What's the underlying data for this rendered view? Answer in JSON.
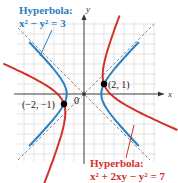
{
  "figure": {
    "blue_title": "Hyperbola:",
    "blue_equation": "x² − y² = 3",
    "red_title": "Hyperbola:",
    "red_equation": "x² + 2xy − y² = 7",
    "axis_x_label": "x",
    "axis_y_label": "y",
    "origin_label": "0",
    "point1_label": "(2, 1)",
    "point2_label": "(−2, −1)",
    "colors": {
      "blue": "#2b7fc3",
      "red": "#d3312b",
      "asymptote": "#888888",
      "grid": "#d8d8d8",
      "axis": "#333333"
    }
  },
  "chart_data": {
    "type": "line",
    "title": "",
    "xlabel": "x",
    "ylabel": "y",
    "xlim": [
      -6.5,
      7
    ],
    "ylim": [
      -6.5,
      7
    ],
    "grid": true,
    "series": [
      {
        "name": "x^2 - y^2 = 3",
        "color": "#2b7fc3",
        "kind": "hyperbola"
      },
      {
        "name": "x^2 + 2xy - y^2 = 7",
        "color": "#d3312b",
        "kind": "hyperbola"
      },
      {
        "name": "asymptote y = x",
        "color": "#888888",
        "kind": "dashed-line"
      },
      {
        "name": "asymptote y = -x",
        "color": "#888888",
        "kind": "dashed-line"
      }
    ],
    "points": [
      {
        "label": "(2, 1)",
        "x": 2,
        "y": 1
      },
      {
        "label": "(−2, −1)",
        "x": -2,
        "y": -1
      }
    ],
    "annotations": [
      "Hyperbola: x² − y² = 3",
      "Hyperbola: x² + 2xy − y² = 7"
    ]
  }
}
